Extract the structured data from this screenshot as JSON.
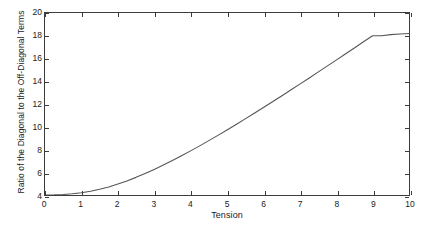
{
  "chart_data": {
    "type": "line",
    "title": "",
    "xlabel": "Tension",
    "ylabel": "Ratio of the Diagonal to the Off-Diagonal Terms",
    "xlim": [
      0,
      10
    ],
    "ylim": [
      4,
      20
    ],
    "xticks": [
      0,
      1,
      2,
      3,
      4,
      5,
      6,
      7,
      8,
      9,
      10
    ],
    "xticklabels": [
      "0",
      "1",
      "2",
      "3",
      "4",
      "5",
      "6",
      "7",
      "8",
      "9",
      "10"
    ],
    "yticks": [
      4,
      6,
      8,
      10,
      12,
      14,
      16,
      18,
      20
    ],
    "yticklabels": [
      "4",
      "6",
      "8",
      "10",
      "12",
      "14",
      "16",
      "18",
      "20"
    ],
    "grid": false,
    "legend": null,
    "series": [
      {
        "name": "ratio",
        "color": "#555555",
        "linewidth": 1,
        "x": [
          0,
          0.25,
          0.5,
          0.75,
          1,
          1.25,
          1.5,
          1.75,
          2,
          2.25,
          2.5,
          2.75,
          3,
          3.25,
          3.5,
          3.75,
          4,
          4.25,
          4.5,
          4.75,
          5,
          5.25,
          5.5,
          5.75,
          6,
          6.25,
          6.5,
          6.75,
          7,
          7.25,
          7.5,
          7.75,
          8,
          8.25,
          8.5,
          8.75,
          9,
          9.25,
          9.5,
          9.75,
          10
        ],
        "y": [
          4.0,
          4.01,
          4.05,
          4.11,
          4.2,
          4.33,
          4.5,
          4.71,
          4.96,
          5.24,
          5.55,
          5.89,
          6.25,
          6.63,
          7.03,
          7.45,
          7.88,
          8.32,
          8.78,
          9.24,
          9.72,
          10.2,
          10.69,
          11.19,
          11.69,
          12.2,
          12.71,
          13.23,
          13.75,
          14.27,
          14.8,
          15.33,
          15.86,
          16.4,
          16.93,
          17.47,
          18.0,
          18.0,
          18.1,
          18.15,
          18.2
        ]
      }
    ],
    "axis_color": "#3c3c3c",
    "background_color": "#ffffff"
  }
}
